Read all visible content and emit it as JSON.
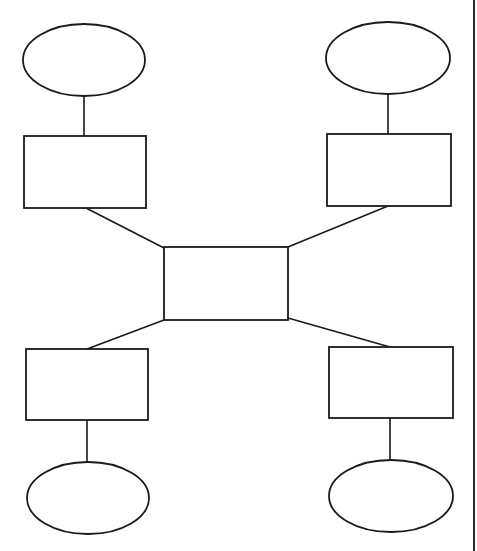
{
  "diagram": {
    "type": "hub-and-spoke",
    "stroke_color": "#1a1a1a",
    "background": "#ffffff",
    "top_text_fragment": "",
    "center": {
      "id": "center-box",
      "shape": "rect",
      "label": "",
      "x": 164,
      "y": 247,
      "w": 124,
      "h": 73
    },
    "branches": [
      {
        "id": "top-left",
        "box": {
          "label": "",
          "x": 24,
          "y": 136,
          "w": 122,
          "h": 72
        },
        "ellipse": {
          "label": "",
          "cx": 84,
          "cy": 60,
          "rx": 61,
          "ry": 36
        },
        "stem": {
          "x1": 84,
          "y1": 96,
          "x2": 84,
          "y2": 136
        },
        "link": {
          "x1": 86,
          "y1": 208,
          "x2": 164,
          "y2": 248
        }
      },
      {
        "id": "top-right",
        "box": {
          "label": "",
          "x": 327,
          "y": 134,
          "w": 124,
          "h": 72
        },
        "ellipse": {
          "label": "",
          "cx": 388,
          "cy": 58,
          "rx": 62,
          "ry": 36
        },
        "stem": {
          "x1": 388,
          "y1": 94,
          "x2": 388,
          "y2": 134
        },
        "link": {
          "x1": 388,
          "y1": 206,
          "x2": 288,
          "y2": 247
        }
      },
      {
        "id": "bottom-left",
        "box": {
          "label": "",
          "x": 26,
          "y": 349,
          "w": 122,
          "h": 71
        },
        "ellipse": {
          "label": "",
          "cx": 88,
          "cy": 498,
          "rx": 61,
          "ry": 36
        },
        "stem": {
          "x1": 87,
          "y1": 420,
          "x2": 87,
          "y2": 462
        },
        "link": {
          "x1": 164,
          "y1": 320,
          "x2": 87,
          "y2": 349
        }
      },
      {
        "id": "bottom-right",
        "box": {
          "label": "",
          "x": 329,
          "y": 347,
          "w": 124,
          "h": 71
        },
        "ellipse": {
          "label": "",
          "cx": 391,
          "cy": 496,
          "rx": 62,
          "ry": 36
        },
        "stem": {
          "x1": 390,
          "y1": 418,
          "x2": 390,
          "y2": 460
        },
        "link": {
          "x1": 288,
          "y1": 318,
          "x2": 390,
          "y2": 347
        }
      }
    ],
    "right_border": {
      "x": 474,
      "y1": 0,
      "y2": 551
    }
  }
}
